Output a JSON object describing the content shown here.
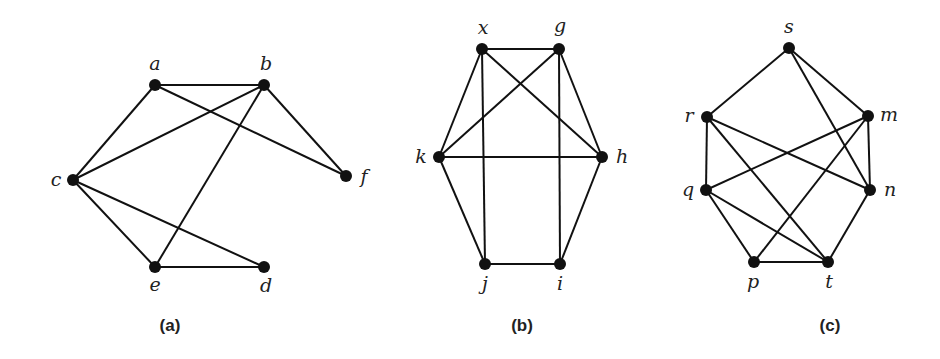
{
  "graphs": [
    {
      "id": "a",
      "caption": "(a)",
      "caption_pos": [
        170,
        331
      ],
      "vertices": [
        {
          "name": "a",
          "x": 155,
          "y": 85,
          "lx": 155,
          "ly": 70
        },
        {
          "name": "b",
          "x": 264,
          "y": 85,
          "lx": 266,
          "ly": 70
        },
        {
          "name": "c",
          "x": 73,
          "y": 180,
          "lx": 56,
          "ly": 186
        },
        {
          "name": "f",
          "x": 346,
          "y": 176,
          "lx": 364,
          "ly": 183
        },
        {
          "name": "e",
          "x": 155,
          "y": 267,
          "lx": 155,
          "ly": 291
        },
        {
          "name": "d",
          "x": 264,
          "y": 267,
          "lx": 266,
          "ly": 292
        }
      ],
      "edges": [
        [
          "a",
          "b"
        ],
        [
          "a",
          "c"
        ],
        [
          "a",
          "f"
        ],
        [
          "b",
          "c"
        ],
        [
          "b",
          "e"
        ],
        [
          "b",
          "f"
        ],
        [
          "c",
          "e"
        ],
        [
          "c",
          "d"
        ],
        [
          "e",
          "d"
        ]
      ]
    },
    {
      "id": "b",
      "caption": "(b)",
      "caption_pos": [
        522,
        331
      ],
      "vertices": [
        {
          "name": "x",
          "x": 482,
          "y": 49,
          "lx": 483,
          "ly": 34
        },
        {
          "name": "g",
          "x": 559,
          "y": 49,
          "lx": 560,
          "ly": 32
        },
        {
          "name": "k",
          "x": 439,
          "y": 157,
          "lx": 421,
          "ly": 163
        },
        {
          "name": "h",
          "x": 602,
          "y": 157,
          "lx": 622,
          "ly": 163
        },
        {
          "name": "j",
          "x": 485,
          "y": 264,
          "lx": 485,
          "ly": 290
        },
        {
          "name": "i",
          "x": 560,
          "y": 264,
          "lx": 560,
          "ly": 290
        }
      ],
      "edges": [
        [
          "x",
          "g"
        ],
        [
          "x",
          "k"
        ],
        [
          "x",
          "j"
        ],
        [
          "x",
          "h"
        ],
        [
          "g",
          "k"
        ],
        [
          "g",
          "i"
        ],
        [
          "g",
          "h"
        ],
        [
          "k",
          "h"
        ],
        [
          "k",
          "j"
        ],
        [
          "h",
          "i"
        ],
        [
          "j",
          "i"
        ]
      ]
    },
    {
      "id": "c",
      "caption": "(c)",
      "caption_pos": [
        830,
        331
      ],
      "vertices": [
        {
          "name": "s",
          "x": 789,
          "y": 48,
          "lx": 789,
          "ly": 33
        },
        {
          "name": "r",
          "x": 707,
          "y": 117,
          "lx": 689,
          "ly": 122
        },
        {
          "name": "m",
          "x": 868,
          "y": 116,
          "lx": 889,
          "ly": 121
        },
        {
          "name": "q",
          "x": 706,
          "y": 190,
          "lx": 688,
          "ly": 196
        },
        {
          "name": "n",
          "x": 870,
          "y": 190,
          "lx": 890,
          "ly": 196
        },
        {
          "name": "p",
          "x": 754,
          "y": 262,
          "lx": 753,
          "ly": 288
        },
        {
          "name": "t",
          "x": 828,
          "y": 262,
          "lx": 829,
          "ly": 288
        }
      ],
      "edges": [
        [
          "s",
          "r"
        ],
        [
          "s",
          "m"
        ],
        [
          "s",
          "n"
        ],
        [
          "r",
          "q"
        ],
        [
          "r",
          "n"
        ],
        [
          "r",
          "t"
        ],
        [
          "m",
          "q"
        ],
        [
          "m",
          "n"
        ],
        [
          "m",
          "p"
        ],
        [
          "q",
          "p"
        ],
        [
          "q",
          "t"
        ],
        [
          "n",
          "t"
        ],
        [
          "p",
          "t"
        ]
      ]
    }
  ],
  "style": {
    "edge_color": "#111111",
    "node_color": "#111111",
    "node_radius": 6,
    "background": "#ffffff"
  }
}
